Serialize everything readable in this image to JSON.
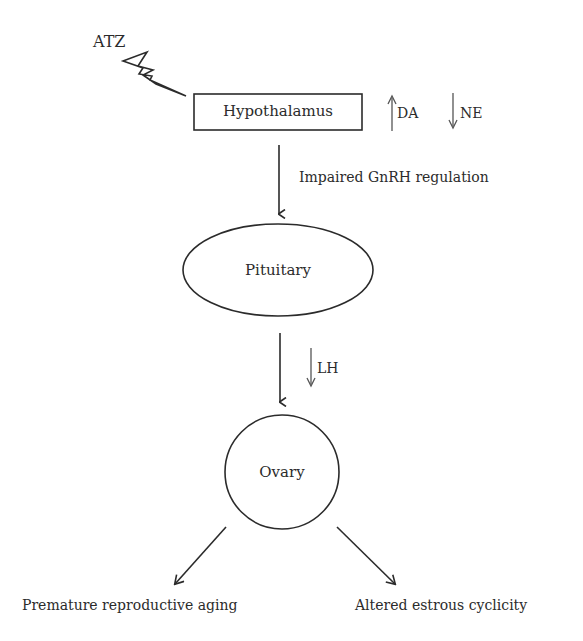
{
  "diagram": {
    "type": "flowchart",
    "stressor": {
      "label": "ATZ",
      "icon": "lightning-bolt-icon"
    },
    "nodes": {
      "hypothalamus": {
        "label": "Hypothalamus",
        "shape": "rectangle"
      },
      "pituitary": {
        "label": "Pituitary",
        "shape": "ellipse"
      },
      "ovary": {
        "label": "Ovary",
        "shape": "circle"
      }
    },
    "hypothalamus_effects": [
      {
        "direction": "up",
        "label": "DA"
      },
      {
        "direction": "down",
        "label": "NE"
      }
    ],
    "edges": {
      "hypothalamus_to_pituitary": {
        "label": "Impaired GnRH regulation"
      },
      "pituitary_to_ovary": {
        "direction": "down",
        "label": "LH"
      }
    },
    "outcomes": [
      {
        "label": "Premature reproductive aging"
      },
      {
        "label": "Altered estrous cyclicity"
      }
    ],
    "colors": {
      "stroke": "#2b2b2b",
      "background": "#ffffff"
    }
  }
}
